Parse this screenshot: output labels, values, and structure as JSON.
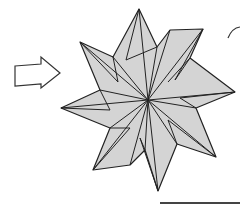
{
  "figure": {
    "description": "Origami diagram step: arrow pointing to an eight-pointed folded star, with a partial curved arrow at top right",
    "colors": {
      "paper_fill": "#d4d4d4",
      "line": "#222222",
      "background": "#ffffff",
      "arrow_fill": "#ffffff",
      "rule": "#444444"
    },
    "step_arrow": {
      "icon": "hollow-right-arrow-icon",
      "points": "15,66 41,64 41,57 60,73 41,88 41,84 15,86"
    },
    "curved_arrow": {
      "icon": "curved-rotate-arrow-icon",
      "path": "M 228 38 Q 232 28 240 27"
    },
    "bottom_rule": {
      "x1": 160,
      "y1": 203,
      "x2": 240,
      "y2": 203
    },
    "star": {
      "center": [
        148,
        100
      ],
      "outline": "139,9 157,47 170,30 203,29 190,58 235,92 196,108 216,157 177,144 158,191 145,150 130,165 93,170 110,128 61,108 100,90 80,42 113,57",
      "creases": [
        "139,9 148,100",
        "139,9 126,60",
        "157,47 148,100",
        "170,30 148,100",
        "203,29 148,100",
        "203,29 175,80",
        "190,58 168,82",
        "235,92 148,100",
        "235,92 180,98",
        "196,108 148,100",
        "216,157 148,100",
        "216,157 168,120",
        "177,144 148,100",
        "158,191 148,100",
        "158,191 140,138",
        "145,150 148,100",
        "130,165 148,100",
        "93,170 148,100",
        "93,170 130,128",
        "110,128 148,100",
        "61,108 148,100",
        "61,108 110,110",
        "100,90 148,100",
        "80,42 148,100",
        "80,42 118,82",
        "113,57 148,100",
        "126,60 157,47",
        "175,80 190,58",
        "180,98 196,108",
        "168,120 177,144",
        "140,138 145,150",
        "130,128 110,128",
        "110,110 100,90",
        "118,82 113,57"
      ]
    }
  }
}
